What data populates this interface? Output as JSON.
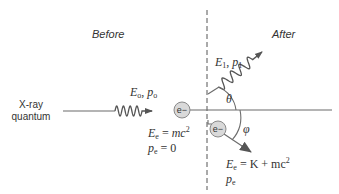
{
  "labels": {
    "before": "Before",
    "after": "After",
    "xray_line1": "X-ray",
    "xray_line2": "quantum",
    "incoming_photon": {
      "E": "E",
      "E_sub": "o",
      "sep": ", ",
      "p": "p",
      "p_sub": "o"
    },
    "scattered_photon": {
      "E": "E",
      "E_sub": "1",
      "sep": ", ",
      "p": "p",
      "p_sub": "1"
    },
    "electron_symbol": "e−",
    "theta": "θ",
    "phi": "φ",
    "electron_before_energy": {
      "E": "E",
      "E_sub": "e",
      "eq": " = ",
      "rhs": "mc",
      "rhs_sup": "2"
    },
    "electron_before_momentum": {
      "p": "p",
      "p_sub": "e",
      "eq": " = 0"
    },
    "electron_after_energy": {
      "E": "E",
      "E_sub": "e",
      "eq": " = ",
      "rhs": "K + mc",
      "rhs_sup": "2"
    },
    "electron_after_momentum": {
      "p": "p",
      "p_sub": "e"
    }
  },
  "colors": {
    "electron_fill": "#d9d9d9",
    "line": "#6b6b6b",
    "text": "#333333"
  }
}
